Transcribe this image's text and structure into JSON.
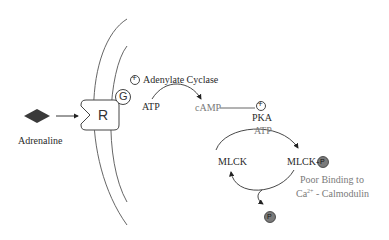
{
  "diagram": {
    "nodes": {
      "adrenaline": "Adrenaline",
      "receptor": "R",
      "g_protein": "G",
      "adenylate_cyclase": "Adenylate Cyclase",
      "atp_1": "ATP",
      "camp": "cAMP",
      "pka": "PKA",
      "atp_2": "ATP",
      "mlck": "MLCK",
      "mlck_p": "MLCK-",
      "phosphate": "P",
      "poor_binding_line1": "Poor Binding to",
      "poor_binding_line2_prefix": "Ca",
      "poor_binding_line2_sup": "2+",
      "poor_binding_line2_suffix": " - Calmodulin",
      "plus": "+"
    },
    "colors": {
      "ligand": "#3a3a3a",
      "phosphate_fill": "#7a7a7a",
      "line": "#333333",
      "text_gray": "#7a7a7a"
    }
  }
}
